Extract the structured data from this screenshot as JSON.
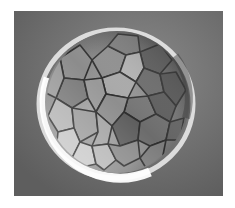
{
  "image": {
    "subject": "embryo-morula-microscopy",
    "description": "Grayscale phase-contrast micrograph of a multicellular embryo (morula) with polygonal blastomere cells inside a bright spherical membrane",
    "colors": {
      "background": "#6b6b6b",
      "halo": "#f2f2f2",
      "cell_light": "#b8b8b8",
      "cell_dark": "#4a4a4a",
      "cell_border": "#2e2e2e",
      "page": "#ffffff"
    }
  }
}
